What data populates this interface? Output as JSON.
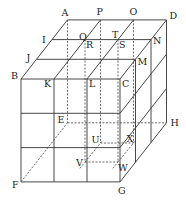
{
  "diagram": {
    "title": "",
    "labels": [
      "A",
      "P",
      "O",
      "D",
      "I",
      "Q",
      "T",
      "N",
      "J",
      "R",
      "S",
      "M",
      "B",
      "K",
      "L",
      "C",
      "E",
      "H",
      "U",
      "X",
      "V",
      "W",
      "F",
      "G"
    ],
    "points": {
      "A": "A",
      "P": "P",
      "O": "O",
      "D": "D",
      "I": "I",
      "Q": "Q",
      "T": "T",
      "N": "N",
      "J": "J",
      "R": "R",
      "S": "S",
      "M": "M",
      "B": "B",
      "K": "K",
      "L": "L",
      "C": "C",
      "E": "E",
      "H": "H",
      "U": "U",
      "X": "X",
      "V": "V",
      "W": "W",
      "F": "F",
      "G": "G"
    },
    "colors": {
      "line": "#333333",
      "text": "#222222",
      "background": "#ffffff"
    }
  }
}
